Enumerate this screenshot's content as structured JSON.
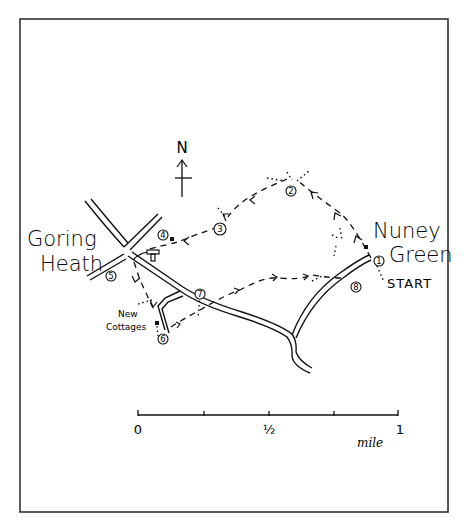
{
  "map": {
    "border_color": "#333333",
    "ink_color": "#111111",
    "background": "#ffffff",
    "north_label": "N",
    "places": {
      "goring_line1": "Goring",
      "goring_line2": "Heath",
      "nuney_line1": "Nuney",
      "nuney_line2": "Green",
      "new_cottages_line1": "New",
      "new_cottages_line2": "Cottages",
      "start": "START"
    },
    "waypoints": [
      {
        "num": "1",
        "x": 379,
        "y": 261
      },
      {
        "num": "2",
        "x": 291,
        "y": 191
      },
      {
        "num": "3",
        "x": 220,
        "y": 229
      },
      {
        "num": "4",
        "x": 163,
        "y": 235
      },
      {
        "num": "5",
        "x": 111,
        "y": 276
      },
      {
        "num": "6",
        "x": 163,
        "y": 339
      },
      {
        "num": "7",
        "x": 200,
        "y": 294
      },
      {
        "num": "8",
        "x": 356,
        "y": 287
      }
    ],
    "legend_symbols": {
      "pub_icon": "T",
      "building": "house-marker"
    },
    "scale": {
      "labels": [
        "0",
        "½",
        "1"
      ],
      "unit": "mile",
      "ticks": 5
    }
  }
}
